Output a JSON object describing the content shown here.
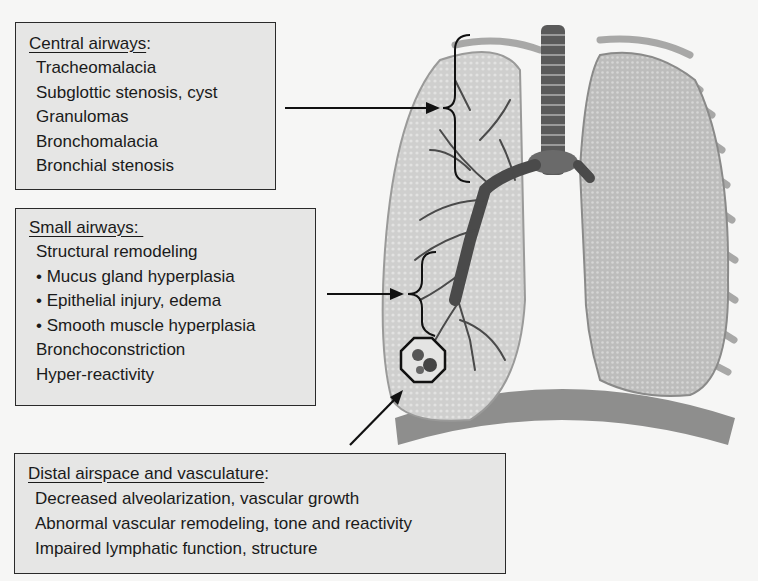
{
  "boxes": {
    "central": {
      "title": "Central airways",
      "title_suffix": ":",
      "items": [
        "Tracheomalacia",
        "Subglottic stenosis, cyst",
        "Granulomas",
        "Bronchomalacia",
        "Bronchial stenosis"
      ]
    },
    "small": {
      "title": "Small airways: ",
      "items": [
        "Structural remodeling",
        "• Mucus gland hyperplasia",
        "• Epithelial injury, edema",
        "• Smooth muscle hyperplasia",
        "Bronchoconstriction",
        "Hyper-reactivity"
      ]
    },
    "distal": {
      "title": "Distal airspace and vasculature",
      "title_suffix": ":",
      "items": [
        "Decreased alveolarization, vascular growth",
        "Abnormal vascular remodeling, tone and reactivity",
        "Impaired lymphatic function, structure"
      ]
    }
  },
  "figure": {
    "colors": {
      "lung": "#c9c9c8",
      "lung_dark": "#9a9a99",
      "airway": "#555555",
      "diaphragm": "#8e8e8d",
      "box_fill": "#e6e6e5",
      "background": "#f6f6f5"
    }
  }
}
